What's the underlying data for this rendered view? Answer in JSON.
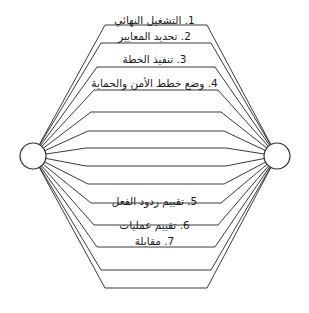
{
  "diagram": {
    "type": "lens-cycle-diagram",
    "background_color": "#ffffff",
    "stroke_color": "#3a3a3a",
    "text_color": "#1a1a1a",
    "nodes": [
      {
        "name": "left-node",
        "shape": "circle",
        "cx": 33,
        "cy": 156,
        "r": 13
      },
      {
        "name": "right-node",
        "shape": "circle",
        "cx": 277,
        "cy": 156,
        "r": 13
      }
    ],
    "labels": [
      {
        "id": "step-1",
        "text": "1. التشغيل النهائي",
        "x": 155,
        "y": 14
      },
      {
        "id": "step-2",
        "text": "2. تحديد المعايير",
        "x": 155,
        "y": 30
      },
      {
        "id": "step-3",
        "text": "3. تنفيذ الخطة",
        "x": 155,
        "y": 53
      },
      {
        "id": "step-4",
        "text": "4. وضع خطط الأمن والحماية",
        "x": 155,
        "y": 77
      },
      {
        "id": "step-5",
        "text": "5. تقييم ردود الفعل",
        "x": 155,
        "y": 195
      },
      {
        "id": "step-6",
        "text": "6. تقييم عمليات",
        "x": 155,
        "y": 219
      },
      {
        "id": "step-7",
        "text": "7. مقابلة",
        "x": 155,
        "y": 235
      }
    ],
    "lens_rings": [
      {
        "id": "ring-1",
        "top_y": 25,
        "bottom_y": 288,
        "top_x1": 105,
        "top_x2": 207
      },
      {
        "id": "ring-2",
        "top_y": 43,
        "bottom_y": 270,
        "top_x1": 101,
        "top_x2": 211
      },
      {
        "id": "ring-3",
        "top_y": 67,
        "bottom_y": 247,
        "top_x1": 97,
        "top_x2": 215
      },
      {
        "id": "ring-4",
        "top_y": 90,
        "bottom_y": 225,
        "top_x1": 94,
        "top_x2": 218
      },
      {
        "id": "ring-5",
        "top_y": 112,
        "bottom_y": 203,
        "top_x1": 91,
        "top_x2": 221
      },
      {
        "id": "ring-6",
        "top_y": 131,
        "bottom_y": 184,
        "top_x1": 88,
        "top_x2": 224
      },
      {
        "id": "ring-7",
        "top_y": 148,
        "bottom_y": 166,
        "top_x1": 86,
        "top_x2": 226
      }
    ]
  }
}
